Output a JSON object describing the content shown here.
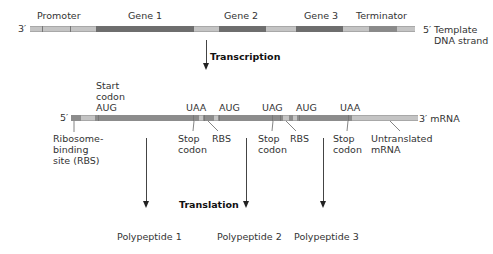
{
  "dna": {
    "end_left": "3′",
    "end_right": "5′",
    "strand_label_line1": "Template",
    "strand_label_line2": "DNA strand",
    "regions": [
      {
        "label": "Promoter"
      },
      {
        "label": "Gene 1"
      },
      {
        "label": "Gene 2"
      },
      {
        "label": "Gene 3"
      },
      {
        "label": "Terminator"
      }
    ]
  },
  "transcription_label": "Transcription",
  "translation_label": "Translation",
  "mrna": {
    "end_left": "5′",
    "end_right": "3′ mRNA",
    "start_codon": {
      "line1": "Start",
      "line2": "codon",
      "line3": "AUG"
    },
    "codons": [
      "UAA",
      "AUG",
      "UAG",
      "AUG",
      "UAA"
    ],
    "rbs_label": {
      "line1": "Ribosome-",
      "line2": "binding",
      "line3": "site (RBS)"
    },
    "stop_codon": {
      "line1": "Stop",
      "line2": "codon"
    },
    "rbs_short": "RBS",
    "untranslated": {
      "line1": "Untranslated",
      "line2": "mRNA"
    }
  },
  "polypeptides": [
    "Polypeptide 1",
    "Polypeptide 2",
    "Polypeptide 3"
  ]
}
